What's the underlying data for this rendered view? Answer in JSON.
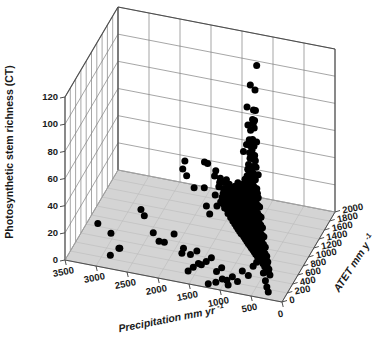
{
  "chart_data": {
    "type": "scatter",
    "projection": "3d",
    "title": "",
    "xlabel": "Precipitation mm yr⁻¹",
    "ylabel": "Photosynthetic stem richness (CT)",
    "zlabel": "ATET mm y⁻¹",
    "xlim": [
      0,
      3500
    ],
    "ylim": [
      0,
      120
    ],
    "zlim": [
      0,
      2000
    ],
    "xticks": [
      3500,
      3000,
      2500,
      2000,
      1500,
      1000,
      500,
      0
    ],
    "yticks": [
      0,
      20,
      40,
      60,
      80,
      100,
      120
    ],
    "zticks": [
      0,
      200,
      400,
      600,
      800,
      1000,
      1200,
      1400,
      1600,
      1800,
      2000
    ],
    "grid": true,
    "legend": "none",
    "marker": {
      "shape": "circle",
      "color": "#000000",
      "size_px": 7
    },
    "floor_color": "#d4d4d4",
    "wall_color": "#ffffff",
    "grid_color": "#808080",
    "axis_color": "#4d4d4d",
    "points": [
      [
        900,
        128,
        1150
      ],
      [
        820,
        119,
        900
      ],
      [
        930,
        119,
        980
      ],
      [
        800,
        105,
        870
      ],
      [
        845,
        104,
        900
      ],
      [
        1000,
        101,
        1020
      ],
      [
        810,
        98,
        860
      ],
      [
        860,
        97,
        900
      ],
      [
        840,
        95,
        880
      ],
      [
        820,
        92,
        870
      ],
      [
        960,
        90,
        960
      ],
      [
        900,
        88,
        920
      ],
      [
        760,
        84,
        820
      ],
      [
        690,
        83,
        560
      ],
      [
        850,
        83,
        880
      ],
      [
        880,
        81,
        900
      ],
      [
        930,
        80,
        940
      ],
      [
        820,
        79,
        860
      ],
      [
        900,
        77,
        910
      ],
      [
        860,
        75,
        880
      ],
      [
        1000,
        74,
        1000
      ],
      [
        800,
        73,
        840
      ],
      [
        870,
        72,
        880
      ],
      [
        920,
        71,
        930
      ],
      [
        780,
        70,
        820
      ],
      [
        840,
        69,
        870
      ],
      [
        900,
        68,
        900
      ],
      [
        760,
        66,
        800
      ],
      [
        810,
        65,
        840
      ],
      [
        1100,
        64,
        1120
      ],
      [
        700,
        63,
        740
      ],
      [
        870,
        62,
        890
      ],
      [
        950,
        61,
        960
      ],
      [
        640,
        60,
        520
      ],
      [
        610,
        58,
        500
      ],
      [
        830,
        59,
        860
      ],
      [
        880,
        58,
        900
      ],
      [
        930,
        57,
        940
      ],
      [
        980,
        56,
        1000
      ],
      [
        780,
        56,
        820
      ],
      [
        820,
        55,
        850
      ],
      [
        860,
        54,
        880
      ],
      [
        900,
        53,
        910
      ],
      [
        940,
        52,
        950
      ],
      [
        990,
        51,
        1000
      ],
      [
        740,
        51,
        780
      ],
      [
        790,
        50,
        820
      ],
      [
        830,
        50,
        860
      ],
      [
        870,
        49,
        890
      ],
      [
        910,
        48,
        930
      ],
      [
        950,
        47,
        970
      ],
      [
        1000,
        47,
        1010
      ],
      [
        1050,
        46,
        1060
      ],
      [
        700,
        46,
        740
      ],
      [
        750,
        45,
        790
      ],
      [
        800,
        45,
        830
      ],
      [
        840,
        44,
        870
      ],
      [
        880,
        44,
        900
      ],
      [
        920,
        43,
        940
      ],
      [
        960,
        43,
        980
      ],
      [
        1000,
        42,
        1020
      ],
      [
        1040,
        42,
        1050
      ],
      [
        1090,
        41,
        1100
      ],
      [
        660,
        41,
        700
      ],
      [
        710,
        40,
        750
      ],
      [
        760,
        40,
        800
      ],
      [
        805,
        40,
        840
      ],
      [
        845,
        39,
        875
      ],
      [
        885,
        39,
        910
      ],
      [
        925,
        38,
        950
      ],
      [
        965,
        38,
        985
      ],
      [
        1005,
        37,
        1025
      ],
      [
        1045,
        37,
        1060
      ],
      [
        1085,
        36,
        1100
      ],
      [
        1130,
        36,
        1145
      ],
      [
        1180,
        35,
        1190
      ],
      [
        1250,
        35,
        1260
      ],
      [
        620,
        35,
        660
      ],
      [
        670,
        34,
        710
      ],
      [
        720,
        34,
        760
      ],
      [
        770,
        34,
        805
      ],
      [
        810,
        33,
        845
      ],
      [
        850,
        33,
        880
      ],
      [
        890,
        33,
        915
      ],
      [
        930,
        32,
        955
      ],
      [
        970,
        32,
        990
      ],
      [
        1010,
        32,
        1030
      ],
      [
        1050,
        31,
        1065
      ],
      [
        1090,
        31,
        1105
      ],
      [
        1130,
        31,
        1145
      ],
      [
        1175,
        30,
        1185
      ],
      [
        1220,
        30,
        1230
      ],
      [
        1270,
        30,
        1280
      ],
      [
        1330,
        29,
        1340
      ],
      [
        580,
        29,
        620
      ],
      [
        630,
        29,
        670
      ],
      [
        680,
        29,
        720
      ],
      [
        730,
        28,
        770
      ],
      [
        775,
        28,
        810
      ],
      [
        815,
        28,
        850
      ],
      [
        855,
        28,
        885
      ],
      [
        895,
        27,
        920
      ],
      [
        935,
        27,
        960
      ],
      [
        975,
        27,
        995
      ],
      [
        1015,
        27,
        1035
      ],
      [
        1055,
        26,
        1070
      ],
      [
        1095,
        26,
        1110
      ],
      [
        1135,
        26,
        1150
      ],
      [
        1175,
        26,
        1190
      ],
      [
        1215,
        25,
        1225
      ],
      [
        1260,
        25,
        1270
      ],
      [
        1310,
        25,
        1320
      ],
      [
        1360,
        25,
        1370
      ],
      [
        1420,
        24,
        1425
      ],
      [
        1490,
        24,
        1495
      ],
      [
        1570,
        24,
        1575
      ],
      [
        540,
        24,
        580
      ],
      [
        590,
        23,
        630
      ],
      [
        640,
        23,
        680
      ],
      [
        690,
        23,
        730
      ],
      [
        740,
        23,
        780
      ],
      [
        785,
        22,
        820
      ],
      [
        825,
        22,
        860
      ],
      [
        865,
        22,
        895
      ],
      [
        905,
        22,
        930
      ],
      [
        945,
        22,
        965
      ],
      [
        985,
        21,
        1005
      ],
      [
        1025,
        21,
        1045
      ],
      [
        1065,
        21,
        1080
      ],
      [
        1105,
        21,
        1120
      ],
      [
        1145,
        21,
        1160
      ],
      [
        1185,
        20,
        1198
      ],
      [
        1225,
        20,
        1238
      ],
      [
        1270,
        20,
        1280
      ],
      [
        1315,
        20,
        1325
      ],
      [
        1365,
        20,
        1375
      ],
      [
        1420,
        19,
        1428
      ],
      [
        1480,
        19,
        1488
      ],
      [
        1550,
        19,
        1558
      ],
      [
        1640,
        19,
        1645
      ],
      [
        1740,
        18,
        1745
      ],
      [
        1870,
        18,
        1875
      ],
      [
        2050,
        18,
        1990
      ],
      [
        2400,
        18,
        1950
      ],
      [
        500,
        18,
        540
      ],
      [
        550,
        18,
        590
      ],
      [
        600,
        18,
        640
      ],
      [
        650,
        17,
        690
      ],
      [
        700,
        17,
        740
      ],
      [
        750,
        17,
        785
      ],
      [
        795,
        17,
        830
      ],
      [
        835,
        17,
        865
      ],
      [
        875,
        17,
        900
      ],
      [
        915,
        16,
        940
      ],
      [
        955,
        16,
        975
      ],
      [
        995,
        16,
        1015
      ],
      [
        1035,
        16,
        1052
      ],
      [
        1075,
        16,
        1092
      ],
      [
        1115,
        16,
        1130
      ],
      [
        1155,
        15,
        1170
      ],
      [
        1195,
        15,
        1208
      ],
      [
        1235,
        15,
        1248
      ],
      [
        1280,
        15,
        1290
      ],
      [
        1325,
        15,
        1335
      ],
      [
        1375,
        15,
        1385
      ],
      [
        1430,
        14,
        1438
      ],
      [
        1490,
        14,
        1498
      ],
      [
        1560,
        14,
        1568
      ],
      [
        1650,
        14,
        1655
      ],
      [
        1760,
        14,
        1765
      ],
      [
        1900,
        13,
        1900
      ],
      [
        460,
        13,
        500
      ],
      [
        510,
        13,
        550
      ],
      [
        560,
        13,
        600
      ],
      [
        610,
        13,
        650
      ],
      [
        660,
        13,
        700
      ],
      [
        710,
        13,
        748
      ],
      [
        760,
        12,
        795
      ],
      [
        800,
        12,
        832
      ],
      [
        840,
        12,
        870
      ],
      [
        880,
        12,
        905
      ],
      [
        920,
        12,
        942
      ],
      [
        960,
        12,
        980
      ],
      [
        1000,
        12,
        1018
      ],
      [
        1040,
        11,
        1057
      ],
      [
        1080,
        11,
        1096
      ],
      [
        1120,
        11,
        1135
      ],
      [
        1160,
        11,
        1175
      ],
      [
        1200,
        11,
        1213
      ],
      [
        1240,
        11,
        1252
      ],
      [
        1285,
        11,
        1295
      ],
      [
        1330,
        10,
        1340
      ],
      [
        1380,
        10,
        1390
      ],
      [
        1435,
        10,
        1443
      ],
      [
        1495,
        10,
        1503
      ],
      [
        1565,
        10,
        1572
      ],
      [
        1660,
        10,
        1665
      ],
      [
        1780,
        10,
        1782
      ],
      [
        430,
        10,
        470
      ],
      [
        480,
        10,
        520
      ],
      [
        530,
        9,
        570
      ],
      [
        580,
        9,
        620
      ],
      [
        630,
        9,
        670
      ],
      [
        680,
        9,
        718
      ],
      [
        730,
        9,
        765
      ],
      [
        775,
        9,
        808
      ],
      [
        815,
        9,
        845
      ],
      [
        855,
        9,
        882
      ],
      [
        895,
        9,
        920
      ],
      [
        935,
        8,
        958
      ],
      [
        975,
        8,
        995
      ],
      [
        1015,
        8,
        1032
      ],
      [
        1055,
        8,
        1072
      ],
      [
        1095,
        8,
        1112
      ],
      [
        1135,
        8,
        1150
      ],
      [
        1175,
        8,
        1190
      ],
      [
        1215,
        8,
        1228
      ],
      [
        1255,
        7,
        1267
      ],
      [
        1300,
        7,
        1310
      ],
      [
        1345,
        7,
        1355
      ],
      [
        1395,
        7,
        1405
      ],
      [
        1450,
        7,
        1458
      ],
      [
        1515,
        7,
        1522
      ],
      [
        1590,
        7,
        1596
      ],
      [
        1690,
        6,
        1694
      ],
      [
        400,
        6,
        440
      ],
      [
        450,
        6,
        490
      ],
      [
        500,
        6,
        540
      ],
      [
        550,
        6,
        592
      ],
      [
        600,
        6,
        640
      ],
      [
        650,
        6,
        688
      ],
      [
        700,
        6,
        738
      ],
      [
        748,
        6,
        782
      ],
      [
        790,
        5,
        822
      ],
      [
        830,
        5,
        858
      ],
      [
        870,
        5,
        896
      ],
      [
        910,
        5,
        934
      ],
      [
        950,
        5,
        970
      ],
      [
        990,
        5,
        1008
      ],
      [
        1030,
        5,
        1047
      ],
      [
        1070,
        5,
        1087
      ],
      [
        1110,
        5,
        1125
      ],
      [
        1150,
        4,
        1165
      ],
      [
        1190,
        4,
        1203
      ],
      [
        1230,
        4,
        1243
      ],
      [
        1272,
        4,
        1283
      ],
      [
        1318,
        4,
        1328
      ],
      [
        1365,
        4,
        1375
      ],
      [
        1418,
        4,
        1427
      ],
      [
        1478,
        4,
        1486
      ],
      [
        1550,
        3,
        1556
      ],
      [
        1645,
        3,
        1650
      ],
      [
        370,
        3,
        410
      ],
      [
        420,
        3,
        462
      ],
      [
        470,
        3,
        512
      ],
      [
        520,
        3,
        562
      ],
      [
        570,
        3,
        612
      ],
      [
        620,
        3,
        660
      ],
      [
        670,
        3,
        710
      ],
      [
        720,
        2,
        756
      ],
      [
        765,
        2,
        798
      ],
      [
        805,
        2,
        836
      ],
      [
        845,
        2,
        874
      ],
      [
        885,
        2,
        910
      ],
      [
        925,
        2,
        948
      ],
      [
        965,
        2,
        985
      ],
      [
        1005,
        2,
        1022
      ],
      [
        1045,
        2,
        1062
      ],
      [
        1085,
        2,
        1100
      ],
      [
        1125,
        2,
        1140
      ],
      [
        1165,
        1,
        1180
      ],
      [
        1205,
        1,
        1218
      ],
      [
        1248,
        1,
        1260
      ],
      [
        1292,
        1,
        1303
      ],
      [
        1340,
        1,
        1350
      ],
      [
        1392,
        1,
        1401
      ],
      [
        1452,
        1,
        1460
      ],
      [
        1525,
        1,
        1531
      ],
      [
        1620,
        1,
        1625
      ],
      [
        1730,
        1,
        1733
      ],
      [
        1880,
        0,
        1878
      ],
      [
        2100,
        0,
        1980
      ],
      [
        2600,
        20,
        760
      ],
      [
        2520,
        18,
        700
      ],
      [
        2350,
        9,
        640
      ],
      [
        2240,
        5,
        600
      ],
      [
        1980,
        14,
        560
      ],
      [
        2120,
        8,
        520
      ],
      [
        1820,
        4,
        480
      ],
      [
        1660,
        6,
        430
      ],
      [
        1540,
        11,
        390
      ],
      [
        1450,
        3,
        350
      ],
      [
        1350,
        8,
        300
      ],
      [
        1250,
        13,
        260
      ],
      [
        1150,
        5,
        220
      ],
      [
        1050,
        10,
        180
      ],
      [
        950,
        3,
        140
      ],
      [
        2900,
        14,
        330
      ],
      [
        2750,
        6,
        280
      ],
      [
        1700,
        16,
        260
      ],
      [
        1600,
        2,
        200
      ],
      [
        1500,
        7,
        160
      ],
      [
        1400,
        12,
        120
      ],
      [
        3150,
        16,
        420
      ],
      [
        2850,
        3,
        190
      ],
      [
        2680,
        11,
        150
      ],
      [
        560,
        14,
        220
      ],
      [
        620,
        8,
        180
      ],
      [
        700,
        12,
        140
      ],
      [
        760,
        5,
        100
      ],
      [
        830,
        9,
        70
      ],
      [
        890,
        3,
        50
      ],
      [
        980,
        7,
        40
      ],
      [
        1080,
        4,
        30
      ],
      [
        1200,
        2,
        25
      ],
      [
        460,
        20,
        300
      ],
      [
        520,
        16,
        260
      ],
      [
        390,
        11,
        210
      ],
      [
        340,
        7,
        170
      ],
      [
        300,
        4,
        130
      ],
      [
        260,
        2,
        90
      ],
      [
        1900,
        58,
        700
      ],
      [
        1820,
        55,
        660
      ],
      [
        1450,
        40,
        540
      ],
      [
        1380,
        36,
        500
      ],
      [
        1250,
        44,
        470
      ],
      [
        1160,
        48,
        440
      ],
      [
        1900,
        36,
        1520
      ],
      [
        2050,
        17,
        1480
      ]
    ]
  },
  "axis_titles": {
    "x": "Precipitation mm yr",
    "x_sup": "-1",
    "y": "Photosynthetic stem richness (CT)",
    "z": "ATET mm y",
    "z_sup": "-1"
  }
}
